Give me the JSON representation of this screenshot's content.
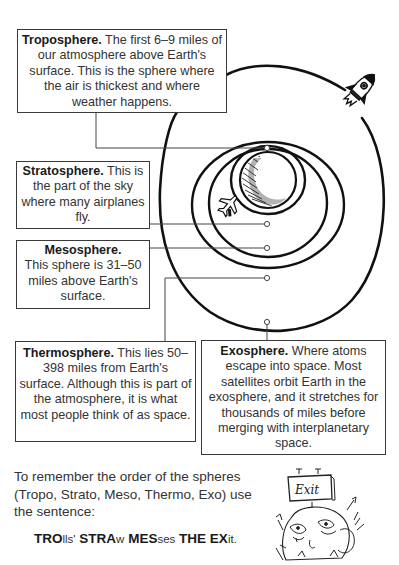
{
  "layers": [
    {
      "id": "troposphere",
      "title": "Troposphere.",
      "text": "The first 6–9 miles of our atmosphere above Earth's surface. This is the sphere where the air is thickest and where weather happens."
    },
    {
      "id": "stratosphere",
      "title": "Stratosphere.",
      "text": "This is the part of the sky where many airplanes fly."
    },
    {
      "id": "mesosphere",
      "title": "Mesosphere.",
      "text": "This sphere is 31–50 miles above Earth's surface."
    },
    {
      "id": "thermosphere",
      "title": "Thermosphere.",
      "text": "This lies 50–398 miles from Earth's surface. Although this is part of the atmosphere, it is what most people think of as space."
    },
    {
      "id": "exosphere",
      "title": "Exosphere.",
      "text": "Where atoms escape into space. Most satellites orbit Earth in the exosphere, and it stretches for thousands of miles before merging with interplanetary space."
    }
  ],
  "intro_text": "To remember the order of the spheres (Tropo, Strato, Meso, Thermo, Exo) use the sentence:",
  "mnemonic": [
    {
      "bold": "TRO",
      "rest": "lls'"
    },
    {
      "bold": "STRA",
      "rest": "w"
    },
    {
      "bold": "MES",
      "rest": "ses"
    },
    {
      "bold": "THE",
      "rest": ""
    },
    {
      "bold": "EX",
      "rest": "it."
    }
  ],
  "illustrations": {
    "rocket": "rocket-icon",
    "airplane": "airplane-icon",
    "earth": "earth-icon",
    "exit_sign": {
      "icon": "exit-sign-icon",
      "label": "Exit"
    },
    "trolls": "trolls-illustration"
  },
  "colors": {
    "ink": "#1a1a1a",
    "text": "#333333",
    "background": "#ffffff"
  }
}
